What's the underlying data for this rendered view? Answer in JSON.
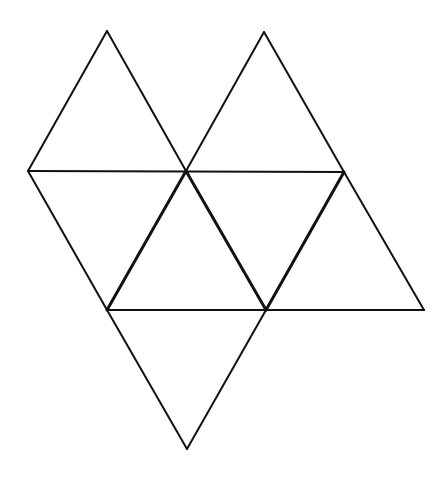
{
  "diagram": {
    "title": "",
    "canvas": {
      "width": 445,
      "height": 480,
      "background": "#ffffff"
    },
    "stroke_color": "#111111",
    "vertices": {
      "A": [
        107,
        31
      ],
      "B": [
        264,
        32
      ],
      "C": [
        28,
        171
      ],
      "D": [
        186,
        171
      ],
      "E": [
        344,
        172
      ],
      "F": [
        107,
        310
      ],
      "G": [
        266,
        310
      ],
      "H": [
        424,
        310
      ],
      "I": [
        187,
        449
      ]
    },
    "edges": [
      {
        "from": "A",
        "to": "C",
        "width": 2
      },
      {
        "from": "A",
        "to": "D",
        "width": 2
      },
      {
        "from": "B",
        "to": "D",
        "width": 2
      },
      {
        "from": "B",
        "to": "E",
        "width": 2
      },
      {
        "from": "C",
        "to": "E",
        "width": 2
      },
      {
        "from": "C",
        "to": "F",
        "width": 2
      },
      {
        "from": "D",
        "to": "F",
        "width": 3
      },
      {
        "from": "D",
        "to": "G",
        "width": 3
      },
      {
        "from": "E",
        "to": "G",
        "width": 3
      },
      {
        "from": "E",
        "to": "H",
        "width": 2
      },
      {
        "from": "F",
        "to": "H",
        "width": 2
      },
      {
        "from": "F",
        "to": "I",
        "width": 2
      },
      {
        "from": "G",
        "to": "I",
        "width": 2
      }
    ],
    "triangles": [
      [
        "A",
        "C",
        "D"
      ],
      [
        "B",
        "D",
        "E"
      ],
      [
        "C",
        "D",
        "F"
      ],
      [
        "D",
        "F",
        "G"
      ],
      [
        "D",
        "E",
        "G"
      ],
      [
        "E",
        "G",
        "H"
      ],
      [
        "F",
        "G",
        "I"
      ]
    ]
  }
}
